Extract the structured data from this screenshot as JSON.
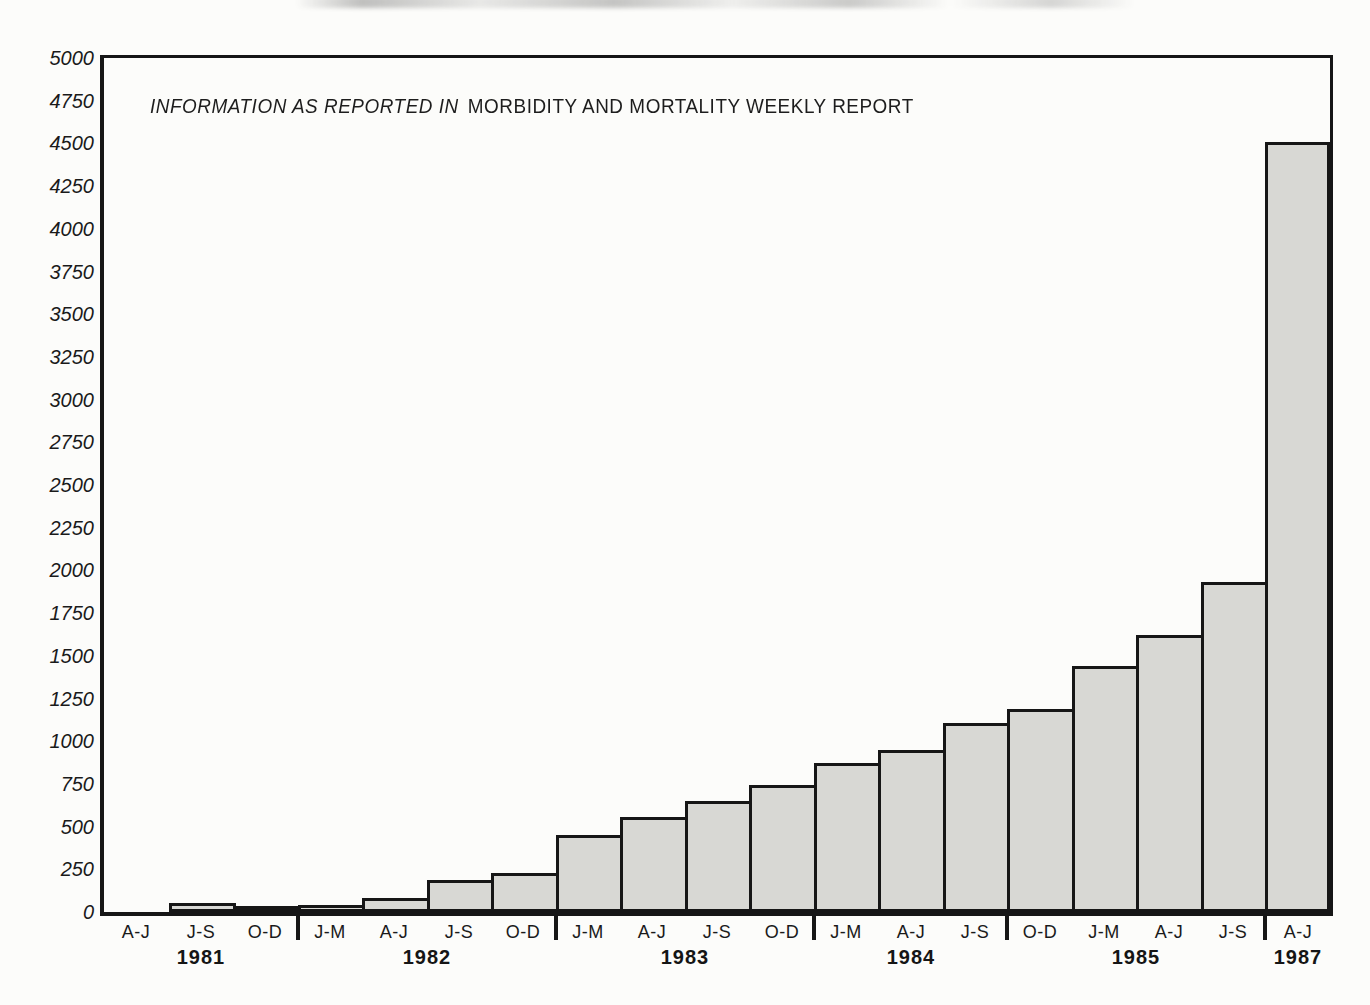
{
  "chart_data": {
    "type": "bar",
    "title_italic_part": "INFORMATION AS REPORTED IN",
    "title_regular_part": "MORBIDITY AND MORTALITY WEEKLY REPORT",
    "xlabel": "",
    "ylabel": "",
    "ylim": [
      0,
      5000
    ],
    "y_tick_interval": 250,
    "y_tick_labels": [
      "5000",
      "4750",
      "4500",
      "4250",
      "4000",
      "3750",
      "3500",
      "3250",
      "3000",
      "2750",
      "2500",
      "2250",
      "2000",
      "1750",
      "1500",
      "1250",
      "1000",
      "750",
      "500",
      "250",
      "0"
    ],
    "grid": false,
    "legend": null,
    "bars": [
      {
        "period": "A-J",
        "year": "1981",
        "value": 0
      },
      {
        "period": "J-S",
        "year": "1981",
        "value": 50
      },
      {
        "period": "O-D",
        "year": "1981",
        "value": 25
      },
      {
        "period": "J-M",
        "year": "1982",
        "value": 40
      },
      {
        "period": "A-J",
        "year": "1982",
        "value": 80
      },
      {
        "period": "J-S",
        "year": "1982",
        "value": 190
      },
      {
        "period": "O-D",
        "year": "1982",
        "value": 230
      },
      {
        "period": "J-M",
        "year": "1983",
        "value": 450
      },
      {
        "period": "A-J",
        "year": "1983",
        "value": 555
      },
      {
        "period": "J-S",
        "year": "1983",
        "value": 650
      },
      {
        "period": "O-D",
        "year": "1983",
        "value": 745
      },
      {
        "period": "J-M",
        "year": "1984",
        "value": 870
      },
      {
        "period": "A-J",
        "year": "1984",
        "value": 950
      },
      {
        "period": "J-S",
        "year": "1984",
        "value": 1105
      },
      {
        "period": "O-D",
        "year": "1985",
        "value": 1190
      },
      {
        "period": "J-M",
        "year": "1985",
        "value": 1440
      },
      {
        "period": "A-J",
        "year": "1985",
        "value": 1620
      },
      {
        "period": "J-S",
        "year": "1985",
        "value": 1935
      },
      {
        "period": "A-J",
        "year": "1987",
        "value": 4510
      }
    ],
    "year_groups": [
      {
        "label": "1981",
        "bar_count": 3
      },
      {
        "label": "1982",
        "bar_count": 4
      },
      {
        "label": "1983",
        "bar_count": 4
      },
      {
        "label": "1984",
        "bar_count": 3
      },
      {
        "label": "1985",
        "bar_count": 4
      },
      {
        "label": "1987",
        "bar_count": 1
      }
    ],
    "colors": {
      "bar_fill": "#d8d8d4",
      "bar_border": "#161616",
      "axis": "#161616",
      "text": "#1c1c1c",
      "background": "#fcfcfa"
    }
  }
}
